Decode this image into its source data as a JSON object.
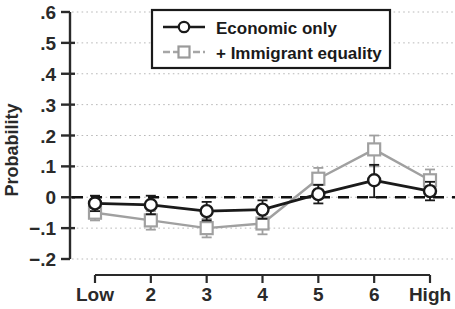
{
  "chart_data": {
    "type": "line",
    "title": "",
    "xlabel": "",
    "ylabel": "Probability",
    "categories": [
      "Low",
      "2",
      "3",
      "4",
      "5",
      "6",
      "High"
    ],
    "x": [
      1,
      2,
      3,
      4,
      5,
      6,
      7
    ],
    "ylim": [
      -0.2,
      0.6
    ],
    "xlim": [
      0.6,
      7.4
    ],
    "grid": true,
    "grid_style": "dotted-horizontal",
    "zero_reference_line": {
      "value": 0,
      "style": "dashed",
      "color": "#111111"
    },
    "legend_position": "top-center",
    "y_ticks": [
      0.6,
      0.5,
      0.4,
      0.3,
      0.2,
      0.1,
      0,
      -0.1,
      -0.2
    ],
    "y_tick_labels": [
      ".6",
      ".5",
      ".4",
      ".3",
      ".2",
      ".1",
      "0",
      "−.1",
      "−.2"
    ],
    "x_tick_labels": [
      "Low",
      "2",
      "3",
      "4",
      "5",
      "6",
      "High"
    ],
    "series": [
      {
        "name": "Economic only",
        "color": "#1a1a1a",
        "marker": "circle",
        "values": [
          -0.02,
          -0.025,
          -0.045,
          -0.04,
          0.01,
          0.055,
          0.02
        ],
        "err_low": [
          -0.045,
          -0.055,
          -0.075,
          -0.07,
          -0.02,
          0.0,
          -0.01
        ],
        "err_high": [
          0.005,
          0.005,
          -0.015,
          -0.01,
          0.04,
          0.105,
          0.05
        ]
      },
      {
        "name": "+ Immigrant equality",
        "color": "#a0a0a0",
        "marker": "square",
        "values": [
          -0.05,
          -0.075,
          -0.1,
          -0.085,
          0.06,
          0.155,
          0.055
        ],
        "err_low": [
          -0.075,
          -0.105,
          -0.13,
          -0.12,
          0.025,
          0.1,
          0.02
        ],
        "err_high": [
          -0.025,
          -0.045,
          -0.07,
          -0.05,
          0.095,
          0.2,
          0.09
        ]
      }
    ]
  },
  "legend": {
    "entries": [
      {
        "label": "Economic only",
        "marker": "circle",
        "color": "#1a1a1a"
      },
      {
        "label": "+ Immigrant equality",
        "marker": "square",
        "color": "#a0a0a0"
      }
    ]
  },
  "axis": {
    "y_title": "Probability"
  }
}
